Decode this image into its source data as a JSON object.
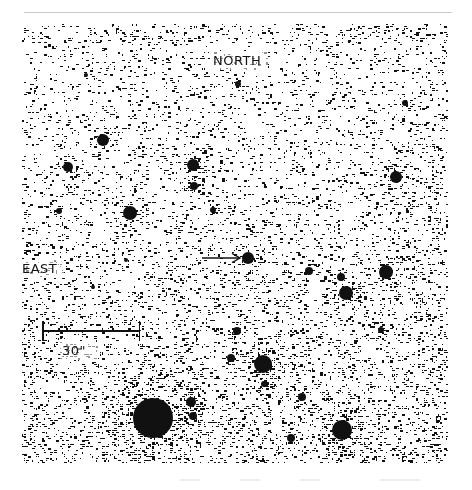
{
  "figure": {
    "type": "astronomical-field-image",
    "background": "#ffffff",
    "ink": "#111111",
    "labels": {
      "north": "NORTH",
      "east": "EAST",
      "scale": "30\""
    },
    "scale_bar": {
      "label": "30\"",
      "x_start": 42,
      "x_end": 139,
      "y": 330
    },
    "arrow": {
      "direction": "right",
      "x_start": 203,
      "x_end": 240,
      "y": 258,
      "target_star": [
        248,
        258
      ]
    },
    "stars": [
      {
        "x": 68,
        "y": 167,
        "r": 5
      },
      {
        "x": 103,
        "y": 140,
        "r": 6
      },
      {
        "x": 130,
        "y": 213,
        "r": 7
      },
      {
        "x": 59,
        "y": 211,
        "r": 3
      },
      {
        "x": 193,
        "y": 165,
        "r": 6
      },
      {
        "x": 194,
        "y": 186,
        "r": 4
      },
      {
        "x": 213,
        "y": 210,
        "r": 3
      },
      {
        "x": 248,
        "y": 258,
        "r": 6
      },
      {
        "x": 396,
        "y": 177,
        "r": 6
      },
      {
        "x": 309,
        "y": 271,
        "r": 4
      },
      {
        "x": 341,
        "y": 277,
        "r": 4
      },
      {
        "x": 346,
        "y": 293,
        "r": 7
      },
      {
        "x": 386,
        "y": 272,
        "r": 7
      },
      {
        "x": 381,
        "y": 330,
        "r": 3
      },
      {
        "x": 237,
        "y": 331,
        "r": 4
      },
      {
        "x": 231,
        "y": 358,
        "r": 4
      },
      {
        "x": 263,
        "y": 364,
        "r": 9
      },
      {
        "x": 264,
        "y": 384,
        "r": 3
      },
      {
        "x": 302,
        "y": 397,
        "r": 4
      },
      {
        "x": 342,
        "y": 430,
        "r": 10
      },
      {
        "x": 291,
        "y": 438,
        "r": 4
      },
      {
        "x": 153,
        "y": 418,
        "r": 20
      },
      {
        "x": 191,
        "y": 402,
        "r": 5
      },
      {
        "x": 193,
        "y": 416,
        "r": 4
      },
      {
        "x": 86,
        "y": 75,
        "r": 2
      },
      {
        "x": 238,
        "y": 84,
        "r": 3
      },
      {
        "x": 405,
        "y": 103,
        "r": 3
      },
      {
        "x": 126,
        "y": 260,
        "r": 2
      },
      {
        "x": 93,
        "y": 287,
        "r": 2
      }
    ]
  }
}
